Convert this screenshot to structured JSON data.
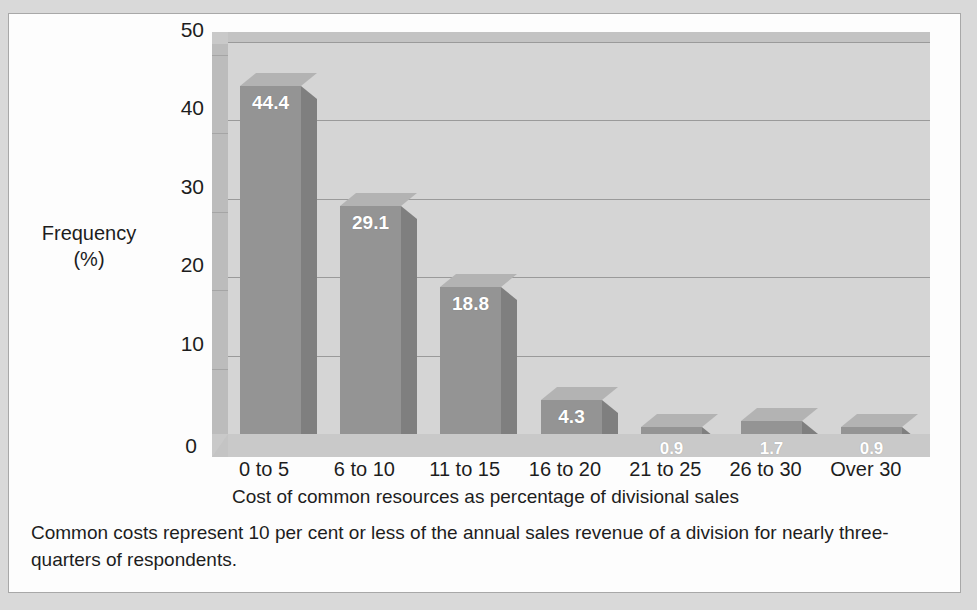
{
  "chart_data": {
    "type": "bar",
    "title": "",
    "xlabel": "Cost of common resources as percentage of divisional sales",
    "ylabel": "Frequency (%)",
    "ylabel_line1": "Frequency",
    "ylabel_line2": "(%)",
    "categories": [
      "0 to 5",
      "6 to 10",
      "11 to 15",
      "16 to 20",
      "21 to 25",
      "26 to 30",
      "Over 30"
    ],
    "values": [
      44.4,
      29.1,
      18.8,
      4.3,
      0.9,
      1.7,
      0.9
    ],
    "value_labels": [
      "44.4",
      "29.1",
      "18.8",
      "4.3",
      "0.9",
      "1.7",
      "0.9"
    ],
    "ylim": [
      0,
      50
    ],
    "yticks": [
      0,
      10,
      20,
      30,
      40,
      50
    ],
    "ytick_labels": [
      "0",
      "10",
      "20",
      "30",
      "40",
      "50"
    ],
    "grid": true,
    "legend": false,
    "style": "3d-column",
    "colors": {
      "bar_front": "#949494",
      "bar_side": "#7f7f7f",
      "bar_top": "#b3b3b3",
      "back_wall": "#d5d5d5",
      "left_wall": "#bcbcbc",
      "floor": "#c9c9c9",
      "gridline": "#9a9a9a",
      "value_label": "#ffffff",
      "axis_text": "#1d1d1d",
      "page_background": "#d9d9d9",
      "frame_background": "#fdfdfd",
      "frame_border": "#a8a8a8"
    }
  },
  "caption": {
    "text": "Common costs represent 10 per cent or less of the annual sales revenue of a division for nearly three-quarters of respondents."
  }
}
